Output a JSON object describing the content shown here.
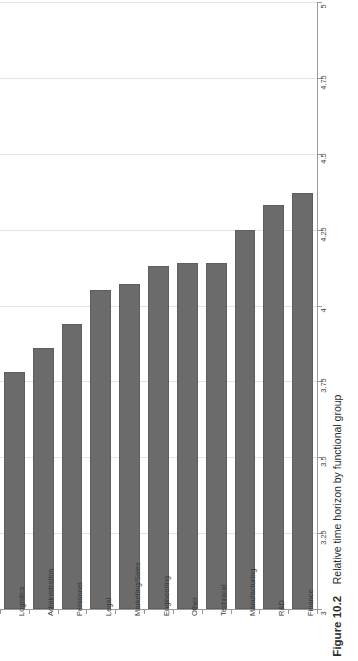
{
  "figure": {
    "caption_label": "Figure 10.2",
    "caption_text": "Relative time horizon by functional group"
  },
  "colors": {
    "bar_fill": "#6b6b6b",
    "bar_stroke": "#5e5e5e",
    "gridline": "#e4e4e4",
    "axis": "#9a9a9a",
    "background": "#ffffff"
  },
  "chart_data": {
    "type": "bar",
    "orientation": "vertical-rotated",
    "title": "Relative time horizon by functional group",
    "xlabel": "",
    "ylabel": "",
    "ylim": [
      3,
      5
    ],
    "grid": true,
    "legend": "none",
    "tick_labels": [
      "3",
      "3.25",
      "3.5",
      "3.75",
      "4",
      "4.25",
      "4.5",
      "4.75",
      "5"
    ],
    "ticks": [
      3,
      3.25,
      3.5,
      3.75,
      4,
      4.25,
      4.5,
      4.75,
      5
    ],
    "categories": [
      "Logistics",
      "Administration",
      "Personnel",
      "Legal",
      "Marketing/Sales",
      "Engineering",
      "Other",
      "Technical",
      "Manufacturing",
      "R&D",
      "Finance"
    ],
    "values": [
      3.78,
      3.86,
      3.94,
      4.05,
      4.07,
      4.13,
      4.14,
      4.14,
      4.25,
      4.33,
      4.37
    ]
  }
}
